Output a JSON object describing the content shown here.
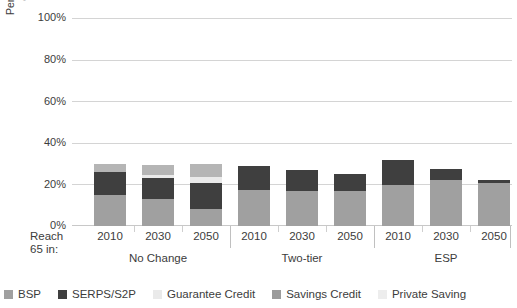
{
  "chart_data": {
    "type": "bar",
    "stacked": true,
    "title": "",
    "subtitle": "",
    "xlabel": "",
    "ylabel": "Pension income as percentage of median earnings at 75",
    "ylabel_lines": [
      "Pension income as percentage",
      "of median earnings at 75"
    ],
    "ylim": [
      0,
      100
    ],
    "y_tick_labels": [
      "0%",
      "20%",
      "40%",
      "60%",
      "80%",
      "100%"
    ],
    "y_tick_values": [
      0,
      20,
      40,
      60,
      80,
      100
    ],
    "grid": "horizontal",
    "legend_position": "bottom",
    "x_axis_corner_label": "Reach 65 in:",
    "x_axis_corner_label_lines": [
      "Reach",
      "65 in:"
    ],
    "categories": [
      "2010",
      "2030",
      "2050",
      "2010",
      "2030",
      "2050",
      "2010",
      "2030",
      "2050"
    ],
    "groups": [
      {
        "name": "No Change",
        "categories": [
          "2010",
          "2030",
          "2050"
        ]
      },
      {
        "name": "Two-tier",
        "categories": [
          "2010",
          "2030",
          "2050"
        ]
      },
      {
        "name": "ESP",
        "categories": [
          "2010",
          "2030",
          "2050"
        ]
      }
    ],
    "series": [
      {
        "name": "BSP",
        "color": "#a0a0a0",
        "values": [
          15.0,
          13.0,
          8.0,
          17.5,
          17.0,
          17.0,
          20.0,
          22.0,
          21.0
        ]
      },
      {
        "name": "SERPS/S2P",
        "color": "#3f3f3f",
        "values": [
          11.0,
          10.0,
          13.0,
          11.5,
          10.0,
          8.0,
          12.0,
          5.5,
          1.0
        ]
      },
      {
        "name": "Guarantee Credit",
        "color": "#eaeaea",
        "values": [
          0.0,
          1.5,
          2.5,
          0.0,
          0.0,
          0.0,
          0.0,
          0.0,
          0.0
        ]
      },
      {
        "name": "Savings Credit",
        "color": "#9b9b9b",
        "values": [
          0.0,
          0.0,
          0.0,
          0.0,
          0.0,
          0.0,
          0.0,
          0.0,
          0.0
        ]
      },
      {
        "name": "Private Saving",
        "color": "#b5b5b5",
        "values": [
          4.0,
          5.0,
          6.5,
          0.0,
          0.0,
          0.0,
          0.0,
          0.0,
          0.0
        ]
      }
    ],
    "totals": [
      30.0,
      29.5,
      30.0,
      29.0,
      27.0,
      25.0,
      32.0,
      27.5,
      22.0
    ]
  },
  "legend": {
    "items": [
      {
        "label": "BSP",
        "color": "#a0a0a0"
      },
      {
        "label": "SERPS/S2P",
        "color": "#3f3f3f"
      },
      {
        "label": "Guarantee Credit",
        "color": "#eaeaea"
      },
      {
        "label": "Savings Credit",
        "color": "#9b9b9b"
      },
      {
        "label": "Private Saving",
        "color": "#ededed"
      }
    ]
  },
  "colors": {
    "background": "#ffffff",
    "gridline": "#d4d4d4",
    "text": "#3c3c3c",
    "separator": "#c0c0c0"
  }
}
